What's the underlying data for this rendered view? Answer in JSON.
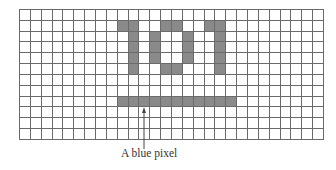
{
  "figure": {
    "grid": {
      "columns": 28,
      "rows": 12,
      "line_color": "#6a6a6a",
      "fill_color": "#8a8a8a"
    },
    "filled_pixels": [
      [
        1,
        9
      ],
      [
        1,
        10
      ],
      [
        2,
        10
      ],
      [
        3,
        10
      ],
      [
        4,
        10
      ],
      [
        5,
        10
      ],
      [
        1,
        13
      ],
      [
        1,
        14
      ],
      [
        2,
        12
      ],
      [
        3,
        12
      ],
      [
        4,
        12
      ],
      [
        2,
        15
      ],
      [
        3,
        15
      ],
      [
        4,
        15
      ],
      [
        5,
        13
      ],
      [
        5,
        14
      ],
      [
        1,
        17
      ],
      [
        1,
        18
      ],
      [
        2,
        18
      ],
      [
        3,
        18
      ],
      [
        4,
        18
      ],
      [
        5,
        18
      ],
      [
        8,
        9
      ],
      [
        8,
        10
      ],
      [
        8,
        11
      ],
      [
        8,
        12
      ],
      [
        8,
        13
      ],
      [
        8,
        14
      ],
      [
        8,
        15
      ],
      [
        8,
        16
      ],
      [
        8,
        17
      ],
      [
        8,
        18
      ],
      [
        8,
        19
      ]
    ],
    "pixel_text": "101",
    "arrow_target": {
      "row": 8,
      "col": 11
    },
    "caption": "A blue pixel"
  }
}
